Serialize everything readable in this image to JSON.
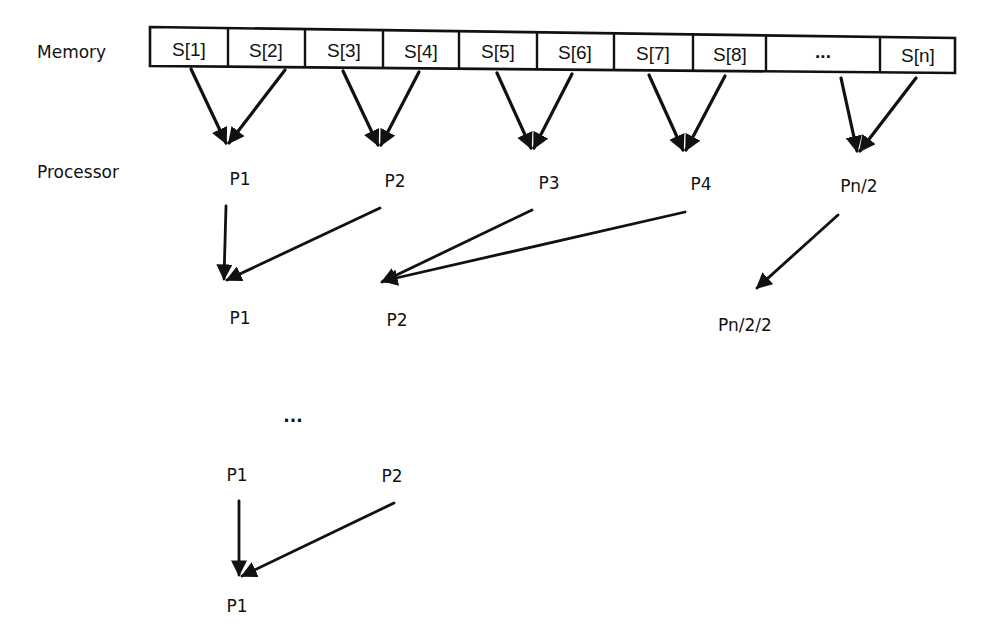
{
  "diagram": {
    "row_labels": {
      "memory": "Memory",
      "processor": "Processor"
    },
    "memory_cells": [
      "S[1]",
      "S[2]",
      "S[3]",
      "S[4]",
      "S[5]",
      "S[6]",
      "S[7]",
      "S[8]",
      "...",
      "S[n]"
    ],
    "level1": {
      "processors": [
        "P1",
        "P2",
        "P3",
        "P4",
        "Pn/2"
      ]
    },
    "level2": {
      "processors": [
        "P1",
        "P2",
        "Pn/2/2"
      ]
    },
    "ellipsis": "...",
    "level_final_minus_1": {
      "processors": [
        "P1",
        "P2"
      ]
    },
    "level_final": {
      "processors": [
        "P1"
      ]
    },
    "colors": {
      "ink": "#111111",
      "background": "#ffffff"
    }
  }
}
